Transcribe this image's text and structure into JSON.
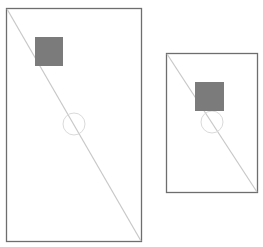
{
  "canvas": {
    "width": 263,
    "height": 247,
    "background": "#ffffff"
  },
  "colors": {
    "frame_stroke": "#6e6e6e",
    "diagonal_stroke": "#c8c8c8",
    "square_fill": "#7b7b7b",
    "circle_stroke": "#dadada"
  },
  "panels": [
    {
      "name": "large-frame",
      "frame": {
        "x": 6.5,
        "y": 8.5,
        "w": 135,
        "h": 233
      },
      "diagonal": {
        "x1": 7,
        "y1": 9,
        "x2": 141,
        "y2": 241
      },
      "square": {
        "x": 35,
        "y": 37,
        "w": 28,
        "h": 29
      },
      "circle": {
        "cx": 74,
        "cy": 124,
        "r": 11
      }
    },
    {
      "name": "small-frame",
      "frame": {
        "x": 166.5,
        "y": 53.5,
        "w": 91,
        "h": 139
      },
      "diagonal": {
        "x1": 167,
        "y1": 54,
        "x2": 257,
        "y2": 192
      },
      "square": {
        "x": 195,
        "y": 82,
        "w": 29,
        "h": 29
      },
      "circle": {
        "cx": 212,
        "cy": 122,
        "r": 11
      }
    }
  ]
}
